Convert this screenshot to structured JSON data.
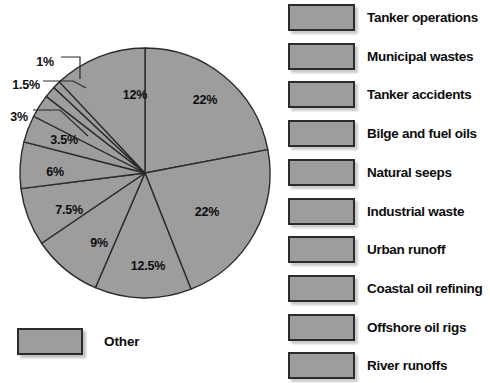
{
  "chart_data": {
    "type": "pie",
    "title": "",
    "subtitle": "",
    "legend_position": "right",
    "grid": false,
    "units": "percent",
    "total": 100,
    "start_angle_deg": 0,
    "direction": "clockwise",
    "categories": [
      "Tanker operations",
      "Municipal wastes",
      "Tanker accidents",
      "Bilge and fuel oils",
      "Natural seeps",
      "Industrial waste",
      "Urban runoff",
      "Coastal oil refining",
      "Offshore oil rigs",
      "River runoffs"
    ],
    "values": [
      22,
      22,
      12.5,
      9,
      7.5,
      6,
      3.5,
      3,
      1.5,
      1
    ],
    "slices": [
      {
        "label": "22%",
        "value": 22,
        "label_placement": "inside",
        "lx": 205,
        "ly": 100
      },
      {
        "label": "22%",
        "value": 22,
        "label_placement": "inside",
        "lx": 207,
        "ly": 212
      },
      {
        "label": "12.5%",
        "value": 12.5,
        "label_placement": "inside",
        "lx": 148,
        "ly": 266
      },
      {
        "label": "9%",
        "value": 9,
        "label_placement": "inside",
        "lx": 99,
        "ly": 243
      },
      {
        "label": "7.5%",
        "value": 7.5,
        "label_placement": "inside",
        "lx": 69,
        "ly": 210
      },
      {
        "label": "6%",
        "value": 6,
        "label_placement": "inside",
        "lx": 55,
        "ly": 172
      },
      {
        "label": "3.5%",
        "value": 3.5,
        "label_placement": "inside",
        "lx": 64,
        "ly": 140
      },
      {
        "label": "3%",
        "value": 3,
        "label_placement": "outside",
        "lx": 19,
        "ly": 117
      },
      {
        "label": "1.5%",
        "value": 1.5,
        "label_placement": "outside",
        "lx": 26,
        "ly": 85
      },
      {
        "label": "1%",
        "value": 1,
        "label_placement": "outside",
        "lx": 45,
        "ly": 62
      },
      {
        "label": "12%",
        "value": 12,
        "label_placement": "inside",
        "lx": 135,
        "ly": 95
      }
    ],
    "other_legend": {
      "label": "Other",
      "swatch_color": "#9d9d9d"
    },
    "colors": {
      "slice_fill": "#9d9d9d",
      "slice_stroke": "#2b2b2b",
      "label_text": "#0d0d0d",
      "background": "#ffffff"
    }
  },
  "legend": {
    "items": [
      {
        "label": "Tanker operations"
      },
      {
        "label": "Municipal wastes"
      },
      {
        "label": "Tanker accidents"
      },
      {
        "label": "Bilge and fuel oils"
      },
      {
        "label": "Natural seeps"
      },
      {
        "label": "Industrial waste"
      },
      {
        "label": "Urban runoff"
      },
      {
        "label": "Coastal oil refining"
      },
      {
        "label": "Offshore oil rigs"
      },
      {
        "label": "River runoffs"
      }
    ]
  }
}
